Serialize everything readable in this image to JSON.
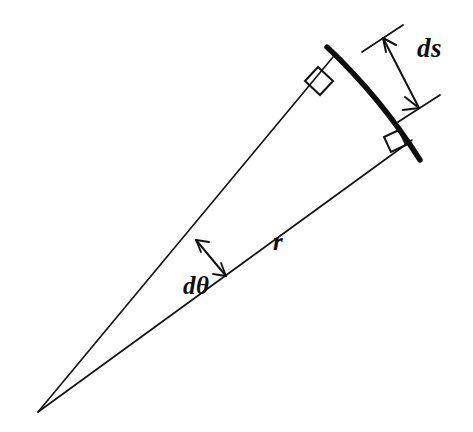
{
  "figure": {
    "background_color": "#ffffff",
    "ink_color": "#0d0d0d",
    "width": 473,
    "height": 432
  },
  "labels": {
    "arc_length": "ds",
    "radius": "r",
    "angle": "dθ"
  },
  "geometry": {
    "apex": {
      "x": 38,
      "y": 412
    },
    "radius_upper_end": {
      "x": 333,
      "y": 57
    },
    "radius_lower_end": {
      "x": 412,
      "y": 140
    },
    "arc_start": {
      "x": 327,
      "y": 47
    },
    "arc_end": {
      "x": 420,
      "y": 160
    },
    "arc_control": {
      "x": 381,
      "y": 98
    },
    "right_angle_upper": {
      "x": 333,
      "y": 57
    },
    "right_angle_lower": {
      "x": 412,
      "y": 140
    },
    "angle_arrow_start": {
      "x": 196,
      "y": 240
    },
    "angle_arrow_end": {
      "x": 226,
      "y": 276
    },
    "ds_dim_start": {
      "x": 383,
      "y": 38
    },
    "ds_dim_end": {
      "x": 419,
      "y": 108
    }
  },
  "elements": {
    "arc_name": "bold-arc-segment",
    "upper_radius_name": "upper-radius-line",
    "lower_radius_name": "lower-radius-line",
    "angle_marker_name": "angle-double-arrow",
    "ds_marker_name": "ds-dimension-double-arrow"
  }
}
